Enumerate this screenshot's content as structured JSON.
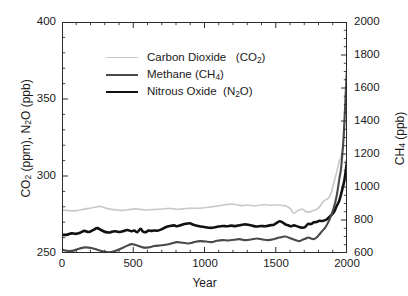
{
  "chart_data": {
    "type": "line",
    "title": "",
    "xlabel": "Year",
    "ylabel_left": "CO2 (ppm),  N2O (ppb)",
    "ylabel_right": "CH4 (ppb)",
    "xlim": [
      0,
      2000
    ],
    "ylim_left": [
      250,
      400
    ],
    "ylim_right": [
      600,
      2000
    ],
    "xticks": [
      0,
      500,
      1000,
      1500,
      2000
    ],
    "yticks_left": [
      250,
      300,
      350,
      400
    ],
    "yticks_right": [
      600,
      800,
      1000,
      1200,
      1400,
      1600,
      1800,
      2000
    ],
    "grid": false,
    "legend_position": "upper-left-inside",
    "minor_ticks_per_interval_x": 5,
    "minor_ticks_per_interval_y_left": 5,
    "minor_ticks_per_interval_y_right": 4,
    "series": [
      {
        "name": "Carbon Dioxide",
        "formula": "CO2",
        "legend_label": "Carbon Dioxide    (CO₂)",
        "axis": "left",
        "unit": "ppm",
        "color": "#c9c9c9",
        "width": 1.6,
        "x": [
          0,
          40,
          80,
          120,
          160,
          200,
          240,
          260,
          300,
          340,
          380,
          420,
          460,
          500,
          540,
          580,
          620,
          660,
          700,
          740,
          780,
          820,
          860,
          900,
          940,
          980,
          1020,
          1060,
          1100,
          1140,
          1180,
          1220,
          1260,
          1300,
          1340,
          1380,
          1420,
          1460,
          1500,
          1540,
          1570,
          1600,
          1610,
          1620,
          1630,
          1640,
          1660,
          1680,
          1700,
          1720,
          1740,
          1760,
          1780,
          1800,
          1820,
          1840,
          1860,
          1880,
          1900,
          1920,
          1940,
          1950,
          1960,
          1970,
          1980,
          1990,
          2000,
          2005
        ],
        "y": [
          278.5,
          278.2,
          278.0,
          278.6,
          279.3,
          279.9,
          280.6,
          280.9,
          279.8,
          279.0,
          278.6,
          278.3,
          278.8,
          279.3,
          279.0,
          278.6,
          278.8,
          279.0,
          279.2,
          279.6,
          279.3,
          279.1,
          279.5,
          279.8,
          279.6,
          279.9,
          280.4,
          280.8,
          281.4,
          282.0,
          282.4,
          282.0,
          281.4,
          281.8,
          281.2,
          281.7,
          282.1,
          281.6,
          282.0,
          281.5,
          281.0,
          279.0,
          277.2,
          276.4,
          276.8,
          277.8,
          278.6,
          279.2,
          277.8,
          277.2,
          277.6,
          278.4,
          279.0,
          280.6,
          283.4,
          285.0,
          286.0,
          289.2,
          296.0,
          303.0,
          310.6,
          313.0,
          317.0,
          325.6,
          338.6,
          354.0,
          369.5,
          380.0
        ]
      },
      {
        "name": "Nitrous Oxide",
        "formula": "N2O",
        "legend_label": "Nitrous Oxide   (N₂O)",
        "axis": "left",
        "unit": "ppb",
        "color": "#111111",
        "width": 2.6,
        "x": [
          0,
          30,
          60,
          90,
          120,
          150,
          180,
          210,
          240,
          270,
          300,
          330,
          360,
          390,
          420,
          450,
          480,
          500,
          520,
          545,
          560,
          580,
          600,
          620,
          640,
          660,
          690,
          720,
          750,
          780,
          800,
          830,
          860,
          890,
          910,
          940,
          970,
          1000,
          1030,
          1060,
          1090,
          1120,
          1150,
          1180,
          1210,
          1240,
          1270,
          1300,
          1330,
          1360,
          1390,
          1420,
          1450,
          1480,
          1500,
          1520,
          1540,
          1560,
          1580,
          1600,
          1620,
          1640,
          1660,
          1680,
          1700,
          1720,
          1740,
          1760,
          1780,
          1800,
          1820,
          1850,
          1880,
          1900,
          1920,
          1940,
          1960,
          1975,
          1990,
          2000,
          2005
        ],
        "y": [
          262.4,
          262.6,
          263.4,
          263.1,
          263.8,
          265.0,
          264.3,
          265.5,
          266.8,
          265.4,
          264.2,
          264.0,
          264.8,
          264.3,
          264.8,
          265.6,
          264.8,
          265.2,
          264.2,
          266.3,
          264.6,
          264.2,
          265.2,
          265.0,
          265.3,
          265.1,
          266.0,
          267.4,
          268.2,
          268.6,
          268.0,
          268.8,
          269.6,
          270.0,
          269.2,
          268.3,
          267.8,
          267.4,
          267.0,
          267.2,
          267.8,
          268.2,
          268.0,
          268.4,
          268.1,
          268.7,
          269.2,
          269.0,
          268.3,
          267.9,
          268.2,
          268.0,
          268.6,
          269.0,
          270.2,
          271.3,
          270.6,
          269.2,
          268.6,
          268.0,
          268.6,
          268.1,
          267.4,
          267.0,
          267.6,
          269.6,
          269.4,
          270.6,
          270.8,
          271.6,
          271.4,
          272.4,
          275.0,
          277.0,
          281.0,
          285.0,
          292.0,
          298.0,
          308.0,
          316.0,
          319.0
        ]
      },
      {
        "name": "Methane",
        "formula": "CH4",
        "legend_label": "Methane  (CH₄)",
        "axis": "right",
        "unit": "ppb",
        "color": "#4a4a4a",
        "width": 2.1,
        "x": [
          0,
          40,
          80,
          120,
          160,
          200,
          240,
          280,
          320,
          360,
          400,
          440,
          480,
          520,
          560,
          600,
          640,
          680,
          720,
          760,
          800,
          840,
          880,
          920,
          960,
          1000,
          1040,
          1080,
          1120,
          1160,
          1200,
          1240,
          1280,
          1320,
          1360,
          1400,
          1440,
          1480,
          1520,
          1560,
          1600,
          1640,
          1660,
          1680,
          1700,
          1720,
          1740,
          1760,
          1780,
          1800,
          1820,
          1840,
          1860,
          1880,
          1900,
          1920,
          1940,
          1950,
          1960,
          1970,
          1980,
          1990,
          2000,
          2005
        ],
        "y": [
          625,
          618,
          622,
          634,
          640,
          636,
          626,
          616,
          610,
          616,
          630,
          646,
          660,
          652,
          640,
          640,
          648,
          652,
          656,
          664,
          672,
          668,
          664,
          672,
          678,
          676,
          672,
          680,
          684,
          682,
          686,
          690,
          684,
          688,
          694,
          688,
          684,
          690,
          700,
          706,
          694,
          682,
          678,
          686,
          692,
          700,
          694,
          690,
          700,
          720,
          740,
          760,
          790,
          830,
          880,
          950,
          1060,
          1110,
          1200,
          1320,
          1500,
          1680,
          1800,
          1915
        ]
      }
    ]
  },
  "axes": {
    "x_tick_labels": [
      "0",
      "500",
      "1000",
      "1500",
      "2000"
    ],
    "y_left_tick_labels": [
      "250",
      "300",
      "350",
      "400"
    ],
    "y_right_tick_labels": [
      "600",
      "800",
      "1000",
      "1200",
      "1400",
      "1600",
      "1800",
      "2000"
    ],
    "x_title": "Year"
  },
  "legend": {
    "items": [
      {
        "key": "co2",
        "label": "Carbon Dioxide",
        "formula_pre": "(CO",
        "formula_sub": "2",
        "formula_post": ")",
        "color": "#c9c9c9"
      },
      {
        "key": "ch4",
        "label": "Methane",
        "formula_pre": "(CH",
        "formula_sub": "4",
        "formula_post": ")",
        "color": "#4a4a4a"
      },
      {
        "key": "n2o",
        "label": "Nitrous Oxide",
        "formula_pre": "(N",
        "formula_sub": "2",
        "formula_post": "O)",
        "color": "#111111"
      }
    ]
  },
  "labels": {
    "y_left_part1_pre": "CO",
    "y_left_part1_sub": "2",
    "y_left_part1_post": " (ppm),  N",
    "y_left_part2_sub": "2",
    "y_left_part2_post": "O  (ppb)",
    "y_right_pre": "CH",
    "y_right_sub": "4",
    "y_right_post": " (ppb)"
  }
}
